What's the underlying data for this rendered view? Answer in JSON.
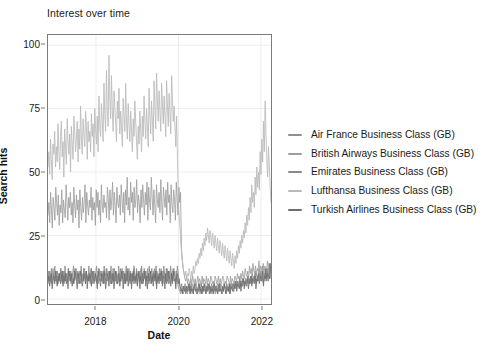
{
  "chart_data": {
    "type": "line",
    "title": "Interest over time",
    "xlabel": "Date",
    "ylabel": "Search hits",
    "grid": true,
    "legend_position": "right",
    "ylim": [
      -2,
      104
    ],
    "yticks": [
      0,
      25,
      50,
      75,
      100
    ],
    "ytick_labels": [
      "0",
      "25",
      "50",
      "75",
      "100"
    ],
    "xlim": [
      "2016-11",
      "2022-04"
    ],
    "xticks": [
      "2018",
      "2020",
      "2022"
    ],
    "xtick_labels": [
      "2018",
      "2020",
      "2022"
    ],
    "x_note": "Weekly Google Trends observations, Nov 2016 - Mar 2022",
    "series": [
      {
        "name": "Air France Business Class (GB)",
        "color": "#8f8f8f",
        "values": [
          9,
          7,
          11,
          8,
          6,
          10,
          12,
          8,
          7,
          9,
          11,
          6,
          8,
          10,
          7,
          12,
          9,
          6,
          8,
          11,
          9,
          7,
          10,
          8,
          12,
          9,
          7,
          11,
          8,
          10,
          6,
          9,
          12,
          8,
          7,
          10,
          9,
          11,
          8,
          6,
          10,
          9,
          7,
          12,
          8,
          11,
          9,
          7,
          10,
          8,
          6,
          12,
          9,
          8,
          11,
          7,
          10,
          9,
          6,
          8,
          12,
          10,
          7,
          9,
          11,
          8,
          6,
          10,
          9,
          12,
          7,
          8,
          11,
          9,
          6,
          10,
          8,
          12,
          7,
          9,
          11,
          6,
          8,
          10,
          9,
          7,
          12,
          8,
          11,
          9,
          6,
          10,
          7,
          8,
          12,
          9,
          11,
          6,
          8,
          10,
          7,
          9,
          12,
          8,
          6,
          11,
          9,
          10,
          7,
          8,
          12,
          9,
          6,
          11,
          8,
          10,
          7,
          9,
          12,
          6,
          8,
          11,
          9,
          7,
          10,
          8,
          12,
          9,
          6,
          11,
          7,
          10,
          8,
          9,
          12,
          6,
          11,
          8,
          10,
          9,
          7,
          12,
          8,
          6,
          11,
          9,
          10,
          7,
          8,
          12,
          9,
          6,
          11,
          8,
          5,
          4,
          3,
          2,
          3,
          4,
          2,
          3,
          5,
          4,
          3,
          2,
          4,
          3,
          5,
          2,
          4,
          3,
          2,
          5,
          4,
          3,
          2,
          4,
          3,
          5,
          2,
          4,
          3,
          2,
          5,
          3,
          4,
          2,
          3,
          5,
          4,
          2,
          3,
          4,
          2,
          5,
          3,
          4,
          2,
          3,
          5,
          2,
          4,
          3,
          5,
          4,
          2,
          3,
          4,
          5,
          3,
          2,
          4,
          3,
          5,
          2,
          4,
          6,
          5,
          4,
          3,
          6,
          5,
          4,
          7,
          5,
          6,
          4,
          7,
          5,
          8,
          6,
          7,
          5,
          8,
          6,
          9,
          7,
          8,
          6,
          9,
          7,
          10,
          8,
          9,
          7,
          11,
          9,
          8,
          10,
          12,
          9,
          11,
          8,
          13,
          10,
          9,
          11,
          8,
          10,
          12,
          9,
          14,
          11,
          9
        ]
      },
      {
        "name": "British Airways Business Class (GB)",
        "color": "#9d9d9d",
        "values": [
          33,
          38,
          30,
          42,
          35,
          28,
          40,
          36,
          31,
          44,
          38,
          33,
          41,
          29,
          37,
          34,
          43,
          30,
          39,
          35,
          32,
          45,
          38,
          31,
          40,
          36,
          42,
          33,
          38,
          30,
          44,
          37,
          32,
          41,
          35,
          39,
          28,
          43,
          36,
          31,
          40,
          34,
          38,
          45,
          30,
          42,
          37,
          33,
          39,
          36,
          44,
          31,
          40,
          35,
          38,
          29,
          43,
          36,
          42,
          33,
          39,
          30,
          45,
          37,
          34,
          41,
          36,
          38,
          32,
          44,
          40,
          31,
          43,
          35,
          39,
          46,
          33,
          42,
          37,
          30,
          44,
          38,
          36,
          41,
          33,
          45,
          39,
          34,
          42,
          30,
          43,
          37,
          48,
          35,
          40,
          33,
          46,
          38,
          42,
          31,
          44,
          36,
          39,
          47,
          34,
          41,
          38,
          30,
          43,
          36,
          45,
          39,
          33,
          42,
          37,
          46,
          31,
          44,
          38,
          35,
          48,
          40,
          33,
          43,
          37,
          30,
          45,
          39,
          36,
          42,
          34,
          47,
          38,
          31,
          44,
          40,
          36,
          43,
          33,
          46,
          38,
          41,
          30,
          45,
          37,
          34,
          43,
          39,
          31,
          46,
          40,
          33,
          44,
          38,
          42,
          20,
          15,
          12,
          10,
          8,
          7,
          9,
          6,
          8,
          7,
          5,
          8,
          6,
          9,
          7,
          6,
          8,
          5,
          7,
          9,
          6,
          8,
          7,
          5,
          9,
          6,
          8,
          7,
          6,
          9,
          5,
          8,
          7,
          6,
          9,
          8,
          6,
          7,
          5,
          9,
          8,
          6,
          7,
          9,
          5,
          8,
          6,
          7,
          9,
          8,
          5,
          7,
          6,
          9,
          8,
          7,
          5,
          9,
          6,
          8,
          7,
          6,
          9,
          8,
          7,
          10,
          8,
          9,
          7,
          10,
          8,
          11,
          9,
          8,
          12,
          10,
          9,
          11,
          8,
          13,
          10,
          12,
          9,
          14,
          11,
          10,
          13,
          9,
          12,
          11,
          15,
          10,
          13,
          12,
          9,
          14,
          11,
          13,
          10,
          12,
          15,
          11,
          14,
          10,
          13
        ]
      },
      {
        "name": "Emirates Business Class (GB)",
        "color": "#8a8a8a",
        "values": [
          8,
          11,
          7,
          9,
          12,
          6,
          10,
          8,
          13,
          7,
          9,
          11,
          6,
          10,
          8,
          12,
          7,
          9,
          11,
          6,
          13,
          8,
          10,
          7,
          12,
          9,
          11,
          6,
          8,
          10,
          13,
          7,
          9,
          12,
          8,
          11,
          6,
          10,
          9,
          13,
          7,
          8,
          12,
          10,
          6,
          11,
          9,
          7,
          13,
          8,
          10,
          12,
          6,
          9,
          11,
          7,
          10,
          13,
          8,
          6,
          12,
          9,
          11,
          7,
          10,
          8,
          13,
          6,
          9,
          12,
          10,
          7,
          11,
          8,
          13,
          6,
          10,
          9,
          12,
          7,
          11,
          8,
          6,
          13,
          10,
          9,
          7,
          12,
          8,
          11,
          6,
          10,
          13,
          7,
          9,
          12,
          8,
          11,
          6,
          10,
          7,
          13,
          9,
          8,
          12,
          6,
          11,
          10,
          7,
          9,
          13,
          8,
          6,
          12,
          10,
          11,
          7,
          9,
          8,
          13,
          6,
          10,
          12,
          7,
          11,
          9,
          8,
          13,
          6,
          10,
          7,
          12,
          9,
          11,
          8,
          6,
          13,
          10,
          7,
          12,
          9,
          11,
          6,
          8,
          13,
          10,
          7,
          12,
          9,
          11,
          6,
          8,
          13,
          10,
          7,
          5,
          4,
          6,
          3,
          5,
          4,
          6,
          3,
          5,
          4,
          6,
          5,
          3,
          4,
          6,
          5,
          3,
          4,
          6,
          5,
          4,
          3,
          6,
          5,
          4,
          6,
          3,
          5,
          4,
          6,
          5,
          3,
          4,
          6,
          5,
          4,
          3,
          6,
          5,
          4,
          6,
          3,
          5,
          4,
          6,
          5,
          3,
          4,
          6,
          5,
          4,
          3,
          6,
          5,
          4,
          6,
          5,
          3,
          4,
          6,
          5,
          4,
          6,
          3,
          5,
          7,
          6,
          5,
          7,
          6,
          8,
          5,
          7,
          6,
          8,
          7,
          5,
          8,
          6,
          7,
          9,
          6,
          8,
          7,
          9,
          6,
          8,
          7,
          10,
          8,
          6,
          9,
          7,
          8,
          10,
          7,
          9,
          8,
          6,
          10,
          7,
          9,
          8,
          11,
          7,
          9,
          8,
          10
        ]
      },
      {
        "name": "Lufthansa Business Class (GB)",
        "color": "#b9b9b9",
        "values": [
          52,
          58,
          49,
          63,
          55,
          47,
          61,
          57,
          66,
          52,
          60,
          54,
          69,
          58,
          51,
          64,
          70,
          56,
          62,
          48,
          67,
          59,
          53,
          71,
          62,
          57,
          65,
          50,
          68,
          61,
          55,
          72,
          66,
          58,
          63,
          70,
          54,
          67,
          59,
          76,
          63,
          57,
          71,
          65,
          60,
          74,
          68,
          55,
          70,
          62,
          66,
          58,
          73,
          64,
          69,
          56,
          75,
          67,
          61,
          72,
          58,
          80,
          68,
          64,
          77,
          70,
          62,
          85,
          73,
          66,
          90,
          75,
          68,
          96,
          79,
          71,
          88,
          74,
          66,
          82,
          76,
          69,
          62,
          78,
          71,
          83,
          65,
          74,
          68,
          60,
          79,
          72,
          66,
          85,
          70,
          63,
          77,
          69,
          62,
          74,
          66,
          58,
          71,
          64,
          78,
          70,
          62,
          55,
          68,
          61,
          74,
          66,
          58,
          72,
          64,
          80,
          70,
          63,
          75,
          68,
          60,
          83,
          72,
          65,
          78,
          70,
          62,
          86,
          75,
          67,
          89,
          78,
          70,
          82,
          74,
          66,
          85,
          77,
          69,
          80,
          72,
          64,
          86,
          76,
          68,
          81,
          73,
          65,
          88,
          79,
          70,
          76,
          68,
          60,
          72,
          55,
          40,
          33,
          28,
          22,
          18,
          15,
          12,
          10,
          9,
          11,
          8,
          10,
          9,
          12,
          10,
          8,
          11,
          9,
          13,
          10,
          12,
          15,
          13,
          16,
          14,
          18,
          16,
          20,
          17,
          22,
          19,
          24,
          21,
          26,
          23,
          28,
          25,
          22,
          27,
          24,
          21,
          26,
          23,
          20,
          25,
          22,
          19,
          24,
          21,
          18,
          23,
          20,
          17,
          22,
          19,
          16,
          21,
          18,
          15,
          20,
          17,
          14,
          19,
          16,
          13,
          18,
          15,
          12,
          17,
          14,
          19,
          16,
          21,
          18,
          23,
          20,
          25,
          22,
          27,
          24,
          30,
          26,
          33,
          29,
          36,
          31,
          40,
          34,
          45,
          38,
          42,
          36,
          48,
          41,
          52,
          44,
          50,
          43,
          58,
          49,
          63,
          54,
          70,
          58,
          78,
          65,
          55,
          48,
          60,
          52,
          44,
          38
        ]
      },
      {
        "name": "Turkish Airlines Business Class (GB)",
        "color": "#6e6e6e",
        "values": [
          6,
          9,
          5,
          8,
          10,
          4,
          7,
          9,
          6,
          11,
          8,
          5,
          9,
          7,
          10,
          6,
          8,
          11,
          5,
          9,
          7,
          10,
          6,
          8,
          4,
          11,
          9,
          7,
          10,
          5,
          8,
          6,
          11,
          9,
          7,
          4,
          10,
          8,
          6,
          11,
          9,
          5,
          7,
          10,
          8,
          6,
          11,
          4,
          9,
          7,
          10,
          8,
          5,
          11,
          9,
          6,
          7,
          10,
          8,
          4,
          11,
          9,
          7,
          5,
          10,
          8,
          6,
          11,
          9,
          4,
          7,
          10,
          8,
          5,
          11,
          9,
          6,
          7,
          10,
          4,
          8,
          11,
          9,
          6,
          7,
          10,
          5,
          8,
          11,
          9,
          4,
          7,
          10,
          6,
          8,
          11,
          5,
          9,
          7,
          10,
          4,
          8,
          11,
          6,
          9,
          7,
          10,
          5,
          8,
          11,
          4,
          9,
          6,
          10,
          7,
          8,
          11,
          5,
          9,
          4,
          10,
          7,
          8,
          11,
          6,
          9,
          5,
          10,
          7,
          11,
          4,
          8,
          9,
          6,
          10,
          7,
          11,
          5,
          8,
          9,
          4,
          10,
          6,
          7,
          11,
          8,
          9,
          5,
          10,
          6,
          11,
          7,
          8,
          4,
          9,
          10,
          6,
          8,
          5,
          3,
          4,
          2,
          5,
          3,
          4,
          2,
          5,
          3,
          4,
          6,
          2,
          5,
          3,
          4,
          2,
          6,
          5,
          3,
          4,
          2,
          5,
          6,
          3,
          4,
          2,
          5,
          3,
          6,
          4,
          2,
          5,
          3,
          4,
          6,
          2,
          5,
          3,
          4,
          2,
          6,
          5,
          3,
          4,
          2,
          5,
          6,
          3,
          4,
          2,
          5,
          3,
          6,
          4,
          2,
          5,
          4,
          3,
          6,
          2,
          5,
          4,
          3,
          6,
          5,
          4,
          7,
          3,
          6,
          5,
          4,
          7,
          3,
          6,
          5,
          8,
          4,
          7,
          6,
          5,
          8,
          4,
          7,
          6,
          9,
          5,
          8,
          7,
          6,
          9,
          4,
          8,
          7,
          10,
          6,
          9,
          8,
          7,
          11,
          5,
          9,
          8,
          12,
          7,
          10,
          9,
          8,
          14,
          10
        ]
      }
    ]
  }
}
